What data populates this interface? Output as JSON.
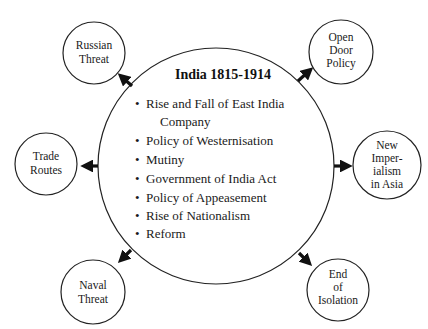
{
  "central": {
    "title": "India 1815-1914",
    "bullet": "•",
    "items": [
      "Rise and Fall of East India",
      "Company",
      "Policy of Westernisation",
      "Mutiny",
      "Government of India Act",
      "Policy of Appeasement",
      "Rise of Nationalism",
      "Reform"
    ]
  },
  "nodes": {
    "russian_threat": {
      "line1": "Russian",
      "line2": "Threat"
    },
    "open_door_policy": {
      "line1": "Open",
      "line2": "Door",
      "line3": "Policy"
    },
    "trade_routes": {
      "line1": "Trade",
      "line2": "Routes"
    },
    "new_imperialism": {
      "line1": "New",
      "line2": "Imper-",
      "line3": "ialism",
      "line4": "in Asia"
    },
    "naval_threat": {
      "line1": "Naval",
      "line2": "Threat"
    },
    "end_of_isolation": {
      "line1": "End",
      "line2": "of",
      "line3": "Isolation"
    }
  },
  "colors": {
    "stroke": "#222222",
    "text": "#1a1a1a",
    "background": "#ffffff"
  }
}
